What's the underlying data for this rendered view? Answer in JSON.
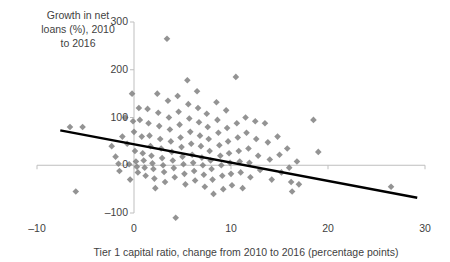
{
  "chart_data": {
    "type": "scatter",
    "title": "",
    "ylabel": "Growth in net\nloans (%), 2010\nto 2016",
    "xlabel": "Tier 1 capital ratio, change from 2010 to 2016 (percentage points)",
    "xlim": [
      -10,
      30
    ],
    "ylim": [
      -100,
      300
    ],
    "xticks": [
      -10,
      0,
      10,
      20,
      30
    ],
    "xtick_labels": [
      "–10",
      "0",
      "10",
      "20",
      "30"
    ],
    "yticks": [
      -100,
      0,
      100,
      200,
      300
    ],
    "ytick_labels": [
      "–100",
      "0",
      "100",
      "200",
      "300"
    ],
    "grid": false,
    "legend": "none",
    "marker": "diamond",
    "marker_color": "#808080",
    "trendline": {
      "color": "#000000",
      "x_start": -7.6,
      "y_start": 73,
      "x_end": 29.2,
      "y_end": -68
    },
    "points": [
      [
        -6.6,
        80
      ],
      [
        -5.3,
        80
      ],
      [
        -6.0,
        -55
      ],
      [
        -2.3,
        40
      ],
      [
        -1.9,
        18
      ],
      [
        -1.6,
        3
      ],
      [
        -1.5,
        -12
      ],
      [
        -1.2,
        60
      ],
      [
        -0.9,
        100
      ],
      [
        -0.7,
        45
      ],
      [
        -0.5,
        2
      ],
      [
        -0.4,
        -30
      ],
      [
        -0.2,
        150
      ],
      [
        -0.1,
        92
      ],
      [
        0.0,
        70
      ],
      [
        0.1,
        30
      ],
      [
        0.2,
        8
      ],
      [
        0.3,
        -3
      ],
      [
        0.4,
        -15
      ],
      [
        0.5,
        120
      ],
      [
        0.6,
        95
      ],
      [
        0.8,
        60
      ],
      [
        0.9,
        25
      ],
      [
        1.0,
        10
      ],
      [
        1.1,
        -5
      ],
      [
        1.2,
        -22
      ],
      [
        1.4,
        118
      ],
      [
        1.5,
        88
      ],
      [
        1.6,
        62
      ],
      [
        1.7,
        40
      ],
      [
        1.8,
        20
      ],
      [
        1.9,
        4
      ],
      [
        2.0,
        -8
      ],
      [
        2.1,
        -28
      ],
      [
        2.2,
        -48
      ],
      [
        2.4,
        150
      ],
      [
        2.5,
        110
      ],
      [
        2.6,
        82
      ],
      [
        2.7,
        55
      ],
      [
        2.8,
        35
      ],
      [
        2.9,
        15
      ],
      [
        3.0,
        0
      ],
      [
        3.1,
        -14
      ],
      [
        3.2,
        -35
      ],
      [
        3.4,
        265
      ],
      [
        3.5,
        135
      ],
      [
        3.6,
        100
      ],
      [
        3.7,
        75
      ],
      [
        3.8,
        50
      ],
      [
        3.9,
        28
      ],
      [
        4.0,
        10
      ],
      [
        4.1,
        -6
      ],
      [
        4.2,
        -25
      ],
      [
        4.3,
        -110
      ],
      [
        4.5,
        145
      ],
      [
        4.6,
        112
      ],
      [
        4.7,
        85
      ],
      [
        4.8,
        58
      ],
      [
        4.9,
        38
      ],
      [
        5.0,
        18
      ],
      [
        5.1,
        2
      ],
      [
        5.2,
        -18
      ],
      [
        5.3,
        -40
      ],
      [
        5.5,
        178
      ],
      [
        5.6,
        128
      ],
      [
        5.7,
        98
      ],
      [
        5.8,
        70
      ],
      [
        5.9,
        45
      ],
      [
        6.0,
        22
      ],
      [
        6.1,
        5
      ],
      [
        6.2,
        -12
      ],
      [
        6.3,
        -32
      ],
      [
        6.5,
        155
      ],
      [
        6.6,
        120
      ],
      [
        6.7,
        90
      ],
      [
        6.8,
        62
      ],
      [
        6.9,
        40
      ],
      [
        7.0,
        16
      ],
      [
        7.1,
        0
      ],
      [
        7.2,
        -20
      ],
      [
        7.3,
        -45
      ],
      [
        7.5,
        108
      ],
      [
        7.6,
        80
      ],
      [
        7.7,
        55
      ],
      [
        7.8,
        30
      ],
      [
        7.9,
        10
      ],
      [
        8.0,
        -8
      ],
      [
        8.1,
        -30
      ],
      [
        8.2,
        -60
      ],
      [
        8.5,
        132
      ],
      [
        8.6,
        95
      ],
      [
        8.7,
        68
      ],
      [
        8.8,
        42
      ],
      [
        8.9,
        20
      ],
      [
        9.0,
        0
      ],
      [
        9.1,
        -22
      ],
      [
        9.2,
        -50
      ],
      [
        9.5,
        115
      ],
      [
        9.6,
        78
      ],
      [
        9.7,
        50
      ],
      [
        9.8,
        25
      ],
      [
        9.9,
        5
      ],
      [
        10.0,
        -18
      ],
      [
        10.1,
        -42
      ],
      [
        10.5,
        185
      ],
      [
        10.6,
        88
      ],
      [
        10.7,
        58
      ],
      [
        10.8,
        30
      ],
      [
        10.9,
        8
      ],
      [
        11.0,
        -15
      ],
      [
        11.2,
        -48
      ],
      [
        11.5,
        100
      ],
      [
        11.6,
        68
      ],
      [
        11.8,
        35
      ],
      [
        11.9,
        5
      ],
      [
        12.0,
        -25
      ],
      [
        12.5,
        92
      ],
      [
        12.6,
        55
      ],
      [
        12.8,
        20
      ],
      [
        13.0,
        -10
      ],
      [
        13.5,
        88
      ],
      [
        13.8,
        48
      ],
      [
        14.0,
        12
      ],
      [
        14.2,
        -30
      ],
      [
        14.8,
        60
      ],
      [
        15.0,
        22
      ],
      [
        15.2,
        -15
      ],
      [
        15.8,
        35
      ],
      [
        16.0,
        -5
      ],
      [
        16.2,
        -35
      ],
      [
        16.3,
        -55
      ],
      [
        16.8,
        8
      ],
      [
        17.0,
        -40
      ],
      [
        18.5,
        95
      ],
      [
        19.0,
        28
      ],
      [
        26.5,
        -45
      ]
    ]
  }
}
